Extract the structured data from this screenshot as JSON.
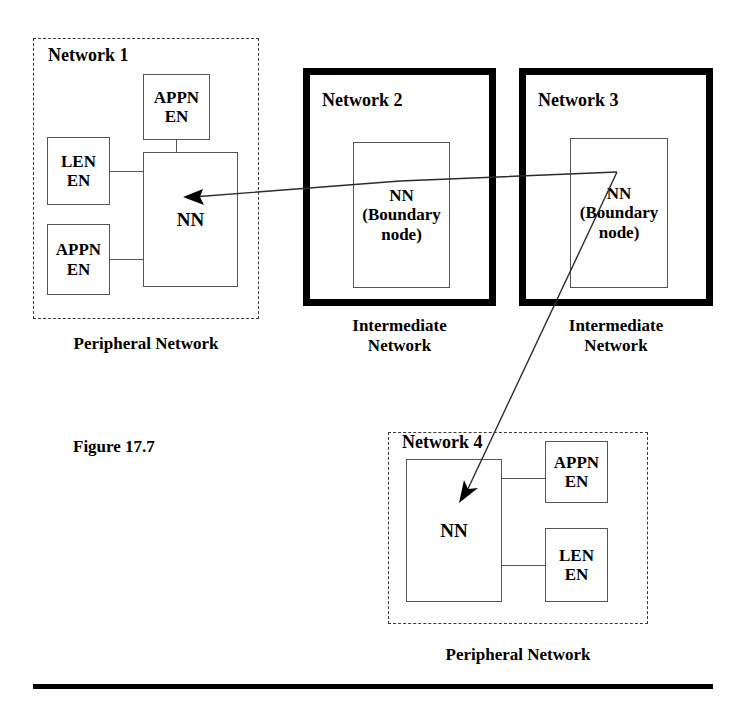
{
  "figure": {
    "number_label": "Figure 17.7",
    "background_color": "#ffffff",
    "ink_color": "#000000",
    "thick_border_color": "#000000",
    "thin_border_color": "#555555",
    "dashed_border_color": "#3a3a3a"
  },
  "networks": {
    "network1": {
      "title": "Network 1",
      "caption": "Peripheral Network",
      "border_style": "dashed",
      "nodes": {
        "appn_top": "APPN\nEN",
        "len_left": "LEN\nEN",
        "appn_bottom": "APPN\nEN",
        "nn": "NN"
      }
    },
    "network2": {
      "title": "Network 2",
      "caption": "Intermediate\nNetwork",
      "border_style": "thick-solid",
      "nodes": {
        "nn": "NN\n(Boundary\nnode)"
      }
    },
    "network3": {
      "title": "Network 3",
      "caption": "Intermediate\nNetwork",
      "border_style": "thick-solid",
      "nodes": {
        "nn": "NN\n(Boundary\nnode)"
      }
    },
    "network4": {
      "title": "Network 4",
      "caption": "Peripheral Network",
      "border_style": "dashed",
      "nodes": {
        "nn": "NN",
        "appn_right": "APPN\nEN",
        "len_right": "LEN\nEN"
      }
    }
  },
  "arrows": [
    {
      "name": "network3-nn-to-network1-nn",
      "from": "Network 3 NN (Boundary node)",
      "to": "Network 1 NN",
      "direction": "right-to-left"
    },
    {
      "name": "network3-nn-to-network4-nn",
      "from": "Network 3 NN (Boundary node)",
      "to": "Network 4 NN",
      "direction": "top-right-to-bottom-left"
    }
  ]
}
